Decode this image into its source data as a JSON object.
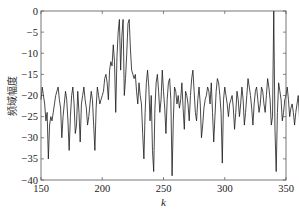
{
  "chart_data": {
    "type": "line",
    "title": "",
    "xlabel": "k",
    "ylabel": "频域幅度",
    "xlim": [
      150,
      350
    ],
    "ylim": [
      -40,
      0
    ],
    "xticks": [
      150,
      200,
      250,
      300,
      350
    ],
    "yticks": [
      0,
      -5,
      -10,
      -15,
      -20,
      -25,
      -30,
      -35,
      -40
    ],
    "xtick_labels": [
      "150",
      "200",
      "250",
      "300",
      "350"
    ],
    "ytick_labels": [
      "0",
      "-5",
      "-10",
      "-15",
      "-20",
      "-25",
      "-30",
      "-35",
      "-40"
    ],
    "grid": false,
    "legend": null,
    "line_color": "#1a1a1a",
    "series": [
      {
        "name": "spectrum",
        "x_start": 150,
        "x_step": 1,
        "values": [
          -21,
          -18,
          -20,
          -22,
          -26,
          -24,
          -35,
          -27,
          -25,
          -26,
          -24,
          -22,
          -20,
          -19,
          -18,
          -21,
          -23,
          -30,
          -25,
          -22,
          -19,
          -21,
          -26,
          -33,
          -25,
          -20,
          -18,
          -22,
          -29,
          -27,
          -19,
          -24,
          -31,
          -22,
          -20,
          -18,
          -21,
          -23,
          -27,
          -25,
          -22,
          -19,
          -21,
          -27,
          -33,
          -23,
          -18,
          -20,
          -22,
          -21,
          -20,
          -19,
          -16,
          -15,
          -17,
          -21,
          -14,
          -12,
          -13,
          -8,
          -12,
          -24,
          -11,
          -5,
          -2,
          -14,
          -6,
          -2,
          -20,
          -16,
          -10,
          -3,
          -2,
          -9,
          -14,
          -15,
          -16,
          -15,
          -19,
          -22,
          -17,
          -20,
          -22,
          -29,
          -35,
          -24,
          -17,
          -14,
          -18,
          -26,
          -20,
          -33,
          -38,
          -23,
          -17,
          -15,
          -19,
          -24,
          -21,
          -14,
          -19,
          -23,
          -29,
          -21,
          -17,
          -16,
          -21,
          -39,
          -26,
          -18,
          -19,
          -22,
          -20,
          -23,
          -21,
          -17,
          -23,
          -28,
          -19,
          -20,
          -22,
          -26,
          -20,
          -16,
          -14,
          -19,
          -24,
          -26,
          -21,
          -18,
          -22,
          -30,
          -27,
          -23,
          -21,
          -20,
          -18,
          -19,
          -22,
          -17,
          -24,
          -31,
          -25,
          -19,
          -16,
          -17,
          -20,
          -24,
          -36,
          -21,
          -18,
          -20,
          -22,
          -25,
          -22,
          -21,
          -20,
          -23,
          -28,
          -24,
          -19,
          -21,
          -25,
          -22,
          -18,
          -21,
          -27,
          -24,
          -20,
          -16,
          -18,
          -20,
          -23,
          -27,
          -22,
          -19,
          -18,
          -21,
          -24,
          -22,
          -18,
          -19,
          -22,
          -24,
          -20,
          -16,
          -18,
          -21,
          -27,
          -25,
          0,
          -28,
          -38,
          -24,
          -17,
          -19,
          -21,
          -26,
          -24,
          -21,
          -20,
          -18,
          -21,
          -25,
          -23,
          -22,
          -24,
          -27,
          -24,
          -22,
          -20,
          -25,
          -28,
          -20,
          -18,
          -22,
          -21,
          -25,
          -30,
          -26,
          -21,
          -19,
          -23,
          -26,
          -20,
          -17,
          -19,
          -28,
          -32,
          -21,
          -18,
          -24,
          -33,
          -27,
          -22,
          -20,
          -19,
          -22,
          -30,
          -35,
          -28,
          -24,
          -22,
          -25,
          -31,
          -21,
          -19,
          -20,
          -18,
          -16,
          -18,
          -19,
          -22,
          -24,
          -27,
          -31,
          -39,
          -28,
          -22,
          -18,
          -20,
          -22,
          -25,
          -31,
          -35,
          -30,
          -24,
          -20,
          -18,
          -22,
          -38,
          -29,
          -23,
          -20,
          -19
        ]
      }
    ]
  }
}
